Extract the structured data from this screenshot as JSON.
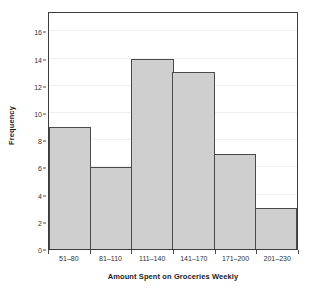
{
  "chart_data": {
    "type": "bar",
    "title": "",
    "subtitle": "",
    "xlabel": "Amount Spent on Groceries Weekly",
    "ylabel": "Frequency",
    "categories": [
      "51–80",
      "81–110",
      "111–140",
      "141–170",
      "171–200",
      "201–230"
    ],
    "values": [
      9,
      6,
      14,
      13,
      7,
      3
    ],
    "ylim": [
      0,
      17.5
    ],
    "yticks": [
      0,
      2,
      4,
      6,
      8,
      10,
      12,
      14,
      16
    ],
    "ytick_labels": [
      "0",
      "2",
      "4",
      "6",
      "8",
      "10",
      "12",
      "14",
      "16"
    ],
    "grid": true,
    "grid_axis": "y",
    "legend": false,
    "legend_position": "none",
    "bar_gap": 0,
    "colors": {
      "bar_fill": "#cfcfcf",
      "bar_edge": "#4a4a4a",
      "frame": "#3c3c3c",
      "gridline": "#efefef",
      "background": "#ffffff",
      "text": "#303030",
      "title_text": "#1a1a1a"
    }
  }
}
